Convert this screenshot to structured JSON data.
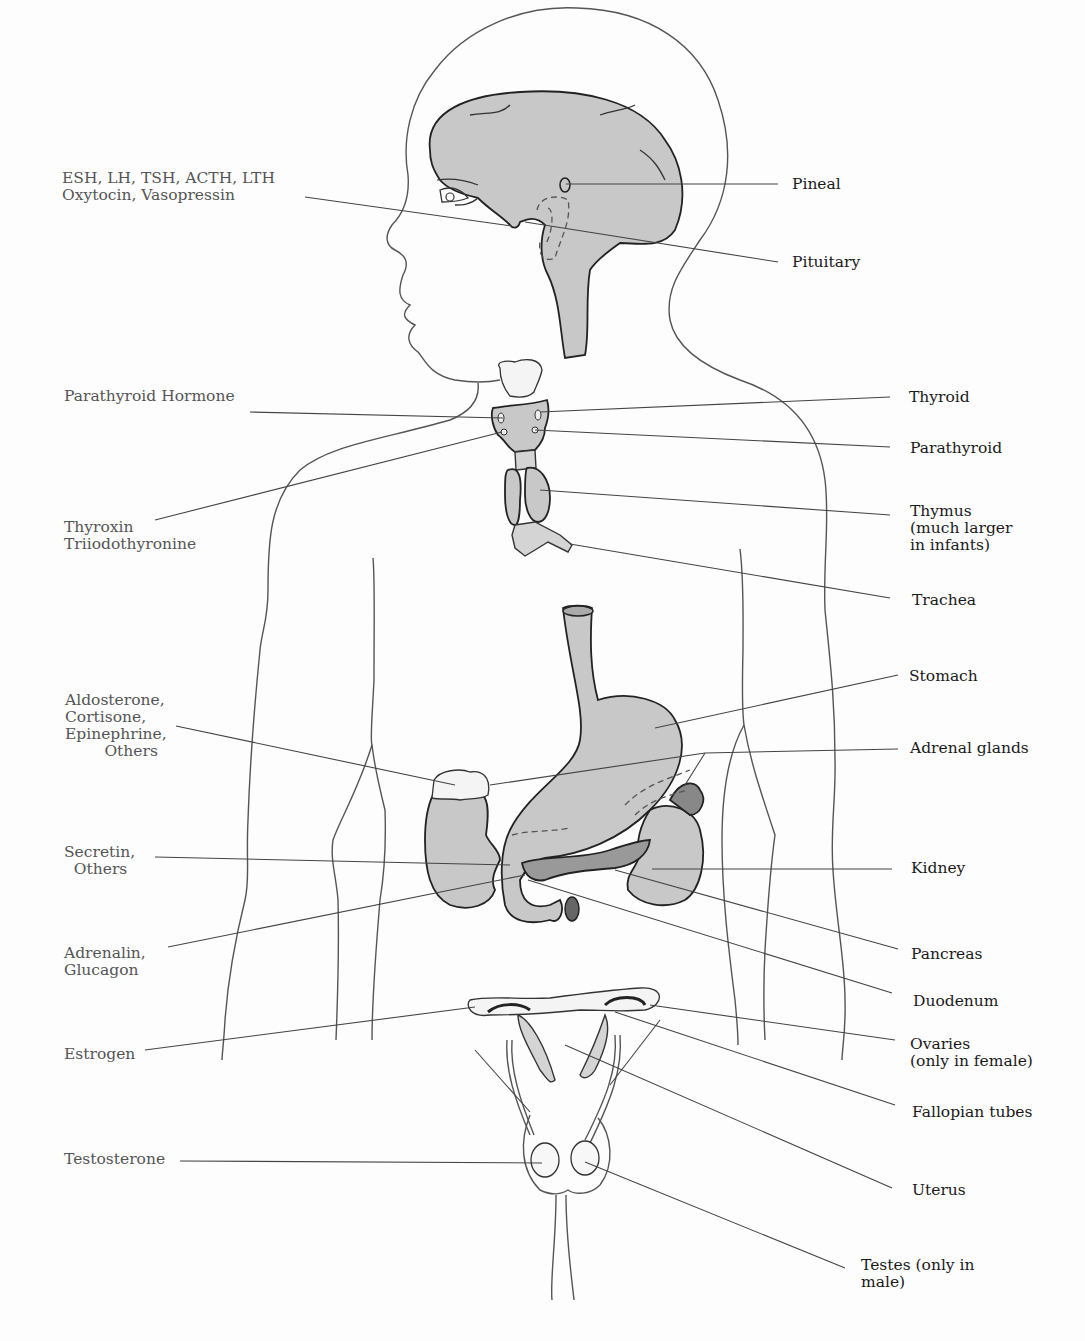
{
  "diagram": {
    "hormones": {
      "pituitary": "ESH, LH, TSH, ACTH, LTH\nOxytocin, Vasopressin",
      "parathyroid": "Parathyroid Hormone",
      "thyroid": "Thyroxin\nTriiodothyronine",
      "adrenal": "Aldosterone,\nCortisone,\nEpinephrine,\n        Others",
      "duodenum": "Secretin,\n  Others",
      "pancreas": "Adrenalin,\nGlucagon",
      "ovaries": "Estrogen",
      "testes": "Testosterone"
    },
    "organs": {
      "pineal": "Pineal",
      "pituitary": "Pituitary",
      "thyroid": "Thyroid",
      "parathyroid": "Parathyroid",
      "thymus": "Thymus\n(much larger\nin infants)",
      "trachea": "Trachea",
      "stomach": "Stomach",
      "adrenal": "Adrenal glands",
      "kidney": "Kidney",
      "pancreas": "Pancreas",
      "duodenum": "Duodenum",
      "ovaries": "Ovaries\n(only in female)",
      "fallopian": "Fallopian tubes",
      "uterus": "Uterus",
      "testes": "Testes (only in\nmale)"
    },
    "colors": {
      "background": "#fdfdfd",
      "organ_fill": "#c8c8c8",
      "hormone_text": "#555555",
      "organ_text": "#1a1a1a",
      "line": "#444444"
    }
  }
}
